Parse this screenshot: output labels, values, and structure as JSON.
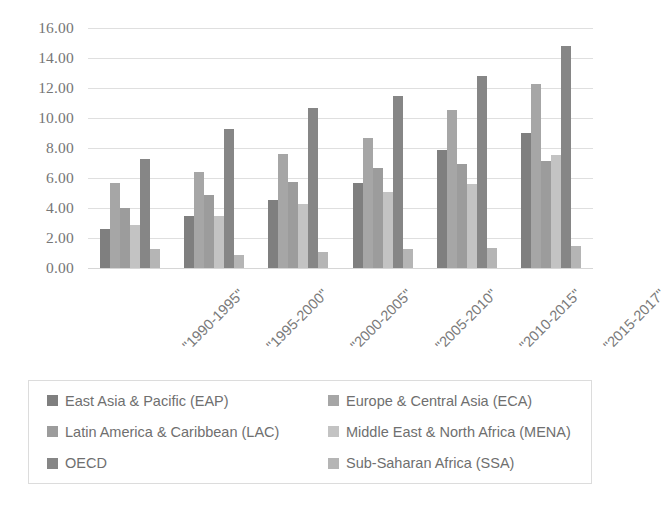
{
  "chart_data": {
    "type": "bar",
    "title": "",
    "subtitle": "",
    "xlabel": "",
    "ylabel": "",
    "ylim": [
      0,
      16
    ],
    "ytick_step": 2,
    "ytick_labels": [
      "0.00",
      "2.00",
      "4.00",
      "6.00",
      "8.00",
      "10.00",
      "12.00",
      "14.00",
      "16.00"
    ],
    "grid": true,
    "grid_axis": "y",
    "legend_position": "bottom",
    "legend_columns": 2,
    "orientation": "vertical",
    "grouping": "grouped",
    "categories": [
      "\"1990-1995\"",
      "\"1995-2000\"",
      "\"2000-2005\"",
      "\"2005-2010\"",
      "\"2010-2015\"",
      "\"2015-2017\""
    ],
    "series": [
      {
        "name": "East Asia & Pacific (EAP)",
        "color": "#7f7f7f",
        "values": [
          2.6,
          3.5,
          4.55,
          5.65,
          7.9,
          9.0
        ]
      },
      {
        "name": "Europe & Central Asia (ECA)",
        "color": "#a6a6a6",
        "values": [
          5.65,
          6.4,
          7.6,
          8.65,
          10.55,
          12.3
        ]
      },
      {
        "name": "Latin America & Caribbean (LAC)",
        "color": "#9c9c9c",
        "values": [
          4.0,
          4.85,
          5.75,
          6.7,
          6.95,
          7.15
        ]
      },
      {
        "name": "Middle East & North Africa (MENA)",
        "color": "#c3c3c3",
        "values": [
          2.9,
          3.5,
          4.3,
          5.1,
          5.6,
          7.55
        ]
      },
      {
        "name": "OECD",
        "color": "#868686",
        "values": [
          7.3,
          9.3,
          10.7,
          11.5,
          12.8,
          14.8
        ]
      },
      {
        "name": "Sub-Saharan Africa (SSA)",
        "color": "#b5b5b5",
        "values": [
          1.25,
          0.9,
          1.1,
          1.25,
          1.35,
          1.5
        ]
      }
    ]
  },
  "legend": {
    "items": [
      {
        "label": "East Asia & Pacific (EAP)",
        "color": "#7f7f7f"
      },
      {
        "label": "Europe & Central Asia (ECA)",
        "color": "#a6a6a6"
      },
      {
        "label": "Latin America & Caribbean (LAC)",
        "color": "#9c9c9c"
      },
      {
        "label": "Middle East & North Africa (MENA)",
        "color": "#c3c3c3"
      },
      {
        "label": "OECD",
        "color": "#868686"
      },
      {
        "label": "Sub-Saharan Africa (SSA)",
        "color": "#b5b5b5"
      }
    ]
  }
}
